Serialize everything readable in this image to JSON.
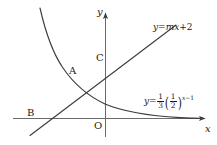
{
  "figure": {
    "type": "math-coordinate-plane-graph",
    "axes": {
      "x_label": "x",
      "y_label": "y",
      "origin_label": "O"
    },
    "points": [
      {
        "id": "A",
        "label": "A",
        "description": "intersection of line and exponential curve"
      },
      {
        "id": "B",
        "label": "B",
        "description": "intersection of line and x-axis"
      },
      {
        "id": "C",
        "label": "C",
        "description": "intersection of line and y-axis"
      }
    ],
    "curves": [
      {
        "id": "line",
        "label_text": "y=mx+2",
        "label_parts": {
          "y": "y",
          "eq": "=",
          "m": "m",
          "x": "x",
          "plus": "+",
          "const": "2"
        }
      },
      {
        "id": "exponential",
        "label_text": "y=1/3(1/2)^(x-1)",
        "label_parts": {
          "y": "y",
          "eq": "=",
          "coef_num": "1",
          "coef_den": "3",
          "base_num": "1",
          "base_den": "2",
          "exp_var": "x",
          "exp_minus": "−",
          "exp_const": "1"
        }
      }
    ],
    "colors": {
      "stroke": "#3d3d3d",
      "text": "#1a1a1a",
      "background": "#ffffff"
    }
  }
}
